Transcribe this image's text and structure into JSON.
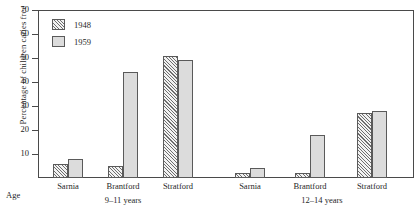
{
  "chart_data": {
    "type": "bar",
    "title": "",
    "xlabel": "Age",
    "ylabel": "Percentage of children caries free",
    "ylim": [
      0,
      70
    ],
    "yticks": [
      10,
      20,
      30,
      40,
      50,
      60,
      70
    ],
    "grid": false,
    "legend_position": "top-left",
    "categories": [
      "Sarnia",
      "Brantford",
      "Stratford",
      "Sarnia",
      "Brantford",
      "Stratford"
    ],
    "groups": [
      {
        "age_label": "9–11 years",
        "categories": [
          "Sarnia",
          "Brantford",
          "Stratford"
        ],
        "series": [
          {
            "name": "1948",
            "values": [
              6,
              5,
              51
            ]
          },
          {
            "name": "1959",
            "values": [
              8,
              44,
              49
            ]
          }
        ]
      },
      {
        "age_label": "12–14 years",
        "categories": [
          "Sarnia",
          "Brantford",
          "Stratford"
        ],
        "series": [
          {
            "name": "1948",
            "values": [
              2,
              2,
              27
            ]
          },
          {
            "name": "1959",
            "values": [
              4,
              18,
              28
            ]
          }
        ]
      }
    ],
    "series": [
      {
        "name": "1948",
        "values": [
          6,
          5,
          51,
          2,
          2,
          27
        ]
      },
      {
        "name": "1959",
        "values": [
          8,
          44,
          49,
          4,
          18,
          28
        ]
      }
    ]
  },
  "legend": {
    "entries": [
      {
        "label": "1948",
        "style": "hatched"
      },
      {
        "label": "1959",
        "style": "solid-gray"
      }
    ]
  },
  "axes": {
    "y_title": "Percentage of children caries free",
    "y_tick_labels": [
      "10",
      "20",
      "30",
      "40",
      "50",
      "60",
      "70"
    ],
    "x_axis_name": "Age",
    "x_category_labels": [
      "Sarnia",
      "Brantford",
      "Stratford",
      "Sarnia",
      "Brantford",
      "Stratford"
    ],
    "x_group_labels": [
      "9–11 years",
      "12–14 years"
    ]
  },
  "colors": {
    "axis": "#4a4a4a",
    "bar_outline": "#5a5a5a",
    "series_1948_fill": "#f2f2f2",
    "series_1948_hatch": "#6e6e6e",
    "series_1959_fill": "#dcdcdc",
    "background": "#ffffff",
    "text": "#1f1f1f"
  }
}
